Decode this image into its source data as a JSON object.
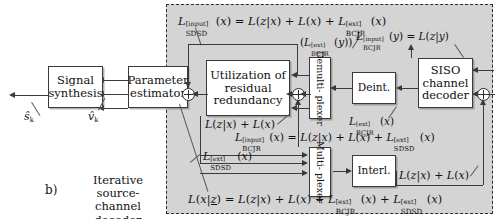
{
  "figure": {
    "part_label": "b)",
    "caption_line1": "Iterative source-",
    "caption_line2": "channel decoder"
  },
  "blocks": {
    "signal_synthesis": {
      "line1": "Signal",
      "line2": "synthesis"
    },
    "parameter_estimator": {
      "line1": "Parameter",
      "line2": "estimator"
    },
    "utilization": {
      "line1": "Utilization of",
      "line2": "residual",
      "line3": "redundancy"
    },
    "demultiplexer": {
      "line1": "Demulti-",
      "line2": "plexer"
    },
    "deinterleaver": {
      "line1": "Deint."
    },
    "siso_decoder": {
      "line1": "SISO",
      "line2": "channel",
      "line3": "decoder"
    },
    "multiplexer": {
      "line1": "Multi-",
      "line2": "plexer"
    },
    "interleaver": {
      "line1": "Interl."
    }
  },
  "signals": {
    "s_hat": "ŝ",
    "s_hat_sub": "k",
    "v_hat": "v̂",
    "v_hat_sub": "k"
  },
  "equations": {
    "sdsd_input": "L_SDSD^[input](x) = L(z|x) + L(x) + L_BCJR^[ext](x)",
    "bcjr_ext_y": "(L_BCJR^[ext](y))",
    "bcjr_input_y": "L_BCJR^[input](y) = L(z|y)",
    "lzx_lx_left": "L(z|x) + L(x)",
    "bcjr_ext_x": "L_BCJR^[ext](x)",
    "bcjr_input_x": "L_BCJR^[input](x) = L(z|x) + L(x) + L_SDSD^[ext](x)",
    "sdsd_ext_x": "L_SDSD^[ext](x)",
    "lzx_lx_right": "L(z|x) + L(x)",
    "aposteriori": "L(x|z̲) = L(z|x) + L(x) + L_BCJR^[ext](x) + L_SDSD^[ext](x)"
  },
  "colors": {
    "region_fill": "#d4d4d4",
    "stroke": "#3a3a3a",
    "block_fill": "#ffffff",
    "text": "#111111"
  }
}
